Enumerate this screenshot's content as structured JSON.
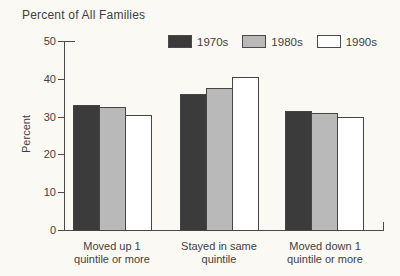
{
  "title": "Percent of All Families",
  "ylabel": "Percent",
  "colors": {
    "background": "#fbf9f3",
    "axis": "#4a4a4a",
    "text": "#3f3f3f",
    "bar_border": "#454545",
    "series_fills": [
      "#3b3b3b",
      "#b9b9b9",
      "#ffffff"
    ]
  },
  "chart_data": {
    "type": "bar",
    "title": "Percent of All Families",
    "xlabel": "",
    "ylabel": "Percent",
    "categories": [
      "Moved up 1 quintile or more",
      "Stayed in same quintile",
      "Moved down 1 quintile or more"
    ],
    "series": [
      {
        "name": "1970s",
        "fill": "#3b3b3b",
        "values": [
          33,
          36,
          31.5
        ]
      },
      {
        "name": "1980s",
        "fill": "#b9b9b9",
        "values": [
          32.5,
          37.5,
          31
        ]
      },
      {
        "name": "1990s",
        "fill": "#ffffff",
        "values": [
          30.5,
          40.5,
          30
        ]
      }
    ],
    "ylim": [
      0,
      50
    ],
    "yticks": [
      0,
      10,
      20,
      30,
      40,
      50
    ],
    "grid": false,
    "legend_position": "top"
  }
}
